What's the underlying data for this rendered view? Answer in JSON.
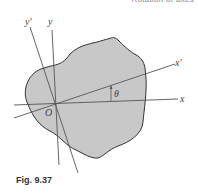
{
  "header": {
    "text": "Rotation of axes"
  },
  "figure": {
    "caption": "Fig. 9.37",
    "labels": {
      "x": "x",
      "y": "y",
      "x_prime": "x′",
      "y_prime": "y′",
      "origin": "O",
      "angle": "θ"
    },
    "colors": {
      "area_fill": "#c8c8c8",
      "outline": "#333333",
      "axis": "#555555"
    }
  }
}
